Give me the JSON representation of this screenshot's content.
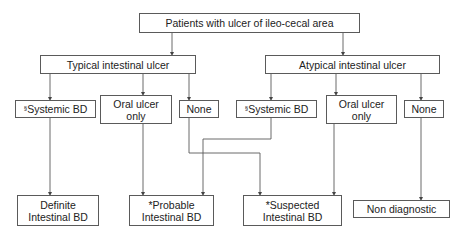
{
  "diagram": {
    "root": {
      "label": "Patients with ulcer of ileo-cecal area"
    },
    "branches": {
      "typical": {
        "label": "Typical intestinal ulcer",
        "children": {
          "systemic": {
            "prefix": "§",
            "label": "Systemic BD"
          },
          "oral": {
            "line1": "Oral ulcer",
            "line2": "only"
          },
          "none": {
            "label": "None"
          }
        }
      },
      "atypical": {
        "label": "Atypical intestinal ulcer",
        "children": {
          "systemic": {
            "prefix": "§",
            "label": "Systemic BD"
          },
          "oral": {
            "line1": "Oral ulcer",
            "line2": "only"
          },
          "none": {
            "label": "None"
          }
        }
      }
    },
    "outcomes": {
      "definite": {
        "line1": "Definite",
        "line2": "Intestinal BD"
      },
      "probable": {
        "line1": "*Probable",
        "line2": "Intestinal BD"
      },
      "suspected": {
        "line1": "*Suspected",
        "line2": "Intestinal BD"
      },
      "non_diagnostic": {
        "label": "Non diagnostic"
      }
    },
    "edges": [
      {
        "from": "root",
        "to": "typical"
      },
      {
        "from": "root",
        "to": "atypical"
      },
      {
        "from": "typical",
        "to": "typical.systemic"
      },
      {
        "from": "typical",
        "to": "typical.oral"
      },
      {
        "from": "typical",
        "to": "typical.none"
      },
      {
        "from": "atypical",
        "to": "atypical.systemic"
      },
      {
        "from": "atypical",
        "to": "atypical.oral"
      },
      {
        "from": "atypical",
        "to": "atypical.none"
      },
      {
        "from": "typical.systemic",
        "to": "definite"
      },
      {
        "from": "typical.oral",
        "to": "probable"
      },
      {
        "from": "atypical.systemic",
        "to": "probable"
      },
      {
        "from": "typical.none",
        "to": "suspected"
      },
      {
        "from": "atypical.oral",
        "to": "suspected"
      },
      {
        "from": "atypical.none",
        "to": "non_diagnostic"
      }
    ],
    "colors": {
      "line": "#5a5a5a",
      "border": "#5a5a5a",
      "background": "#ffffff",
      "text": "#222222"
    }
  }
}
